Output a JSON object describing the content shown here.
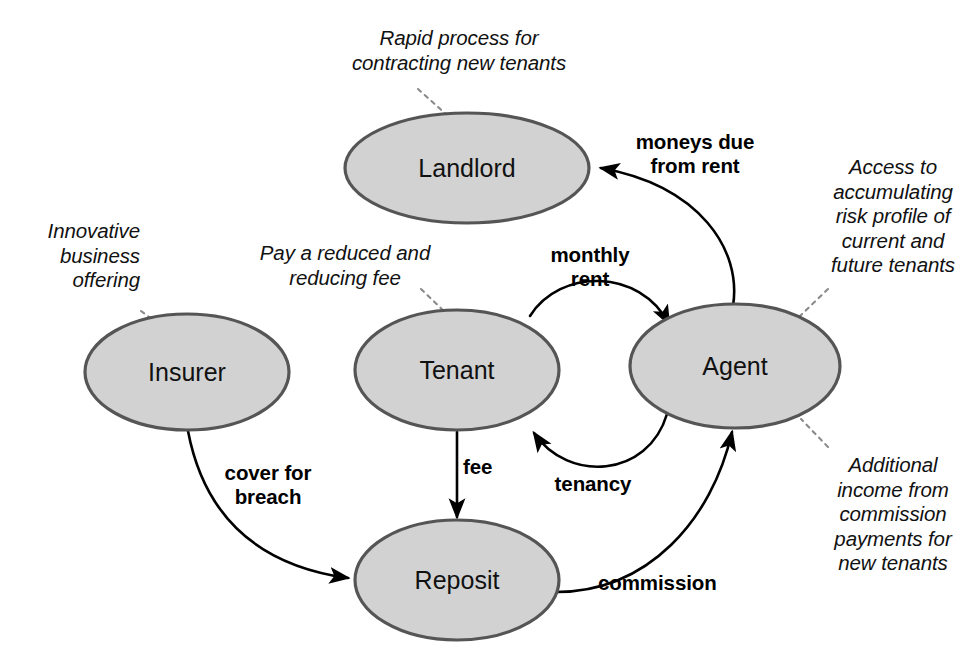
{
  "diagram": {
    "type": "node-link-diagram",
    "colors": {
      "node_fill": "#d2d2d2",
      "node_border": "#555555",
      "edge": "#000000",
      "leader": "#8a8a8a",
      "background": "#ffffff",
      "text": "#111111"
    },
    "nodes": [
      {
        "id": "landlord",
        "label": "Landlord",
        "cx": 467,
        "cy": 168,
        "rx": 122,
        "ry": 55
      },
      {
        "id": "insurer",
        "label": "Insurer",
        "cx": 187,
        "cy": 372,
        "rx": 102,
        "ry": 58
      },
      {
        "id": "tenant",
        "label": "Tenant",
        "cx": 457,
        "cy": 370,
        "rx": 102,
        "ry": 60
      },
      {
        "id": "agent",
        "label": "Agent",
        "cx": 735,
        "cy": 366,
        "rx": 105,
        "ry": 62
      },
      {
        "id": "reposit",
        "label": "Reposit",
        "cx": 457,
        "cy": 580,
        "rx": 102,
        "ry": 60
      }
    ],
    "edges": [
      {
        "id": "agent-to-landlord",
        "from": "agent",
        "to": "landlord",
        "label": "moneys due\nfrom rent"
      },
      {
        "id": "tenant-to-agent",
        "from": "tenant",
        "to": "agent",
        "label": "monthly\nrent"
      },
      {
        "id": "agent-to-tenant",
        "from": "agent",
        "to": "tenant",
        "label": "tenancy"
      },
      {
        "id": "insurer-to-reposit",
        "from": "insurer",
        "to": "reposit",
        "label": "cover for\nbreach"
      },
      {
        "id": "tenant-to-reposit",
        "from": "tenant",
        "to": "reposit",
        "label": "fee"
      },
      {
        "id": "reposit-to-agent",
        "from": "reposit",
        "to": "agent",
        "label": "commission"
      }
    ],
    "annotations": [
      {
        "id": "landlord-note",
        "target": "landlord",
        "text": "Rapid process for\ncontracting new tenants"
      },
      {
        "id": "insurer-note",
        "target": "insurer",
        "text": "Innovative\nbusiness\noffering"
      },
      {
        "id": "tenant-note",
        "target": "tenant",
        "text": "Pay a reduced and\nreducing fee"
      },
      {
        "id": "agent-note-top",
        "target": "agent",
        "text": "Access to\naccumulating\nrisk profile of\ncurrent and\nfuture tenants"
      },
      {
        "id": "agent-note-bottom",
        "target": "agent",
        "text": "Additional\nincome from\ncommission\npayments  for\nnew tenants"
      }
    ]
  }
}
